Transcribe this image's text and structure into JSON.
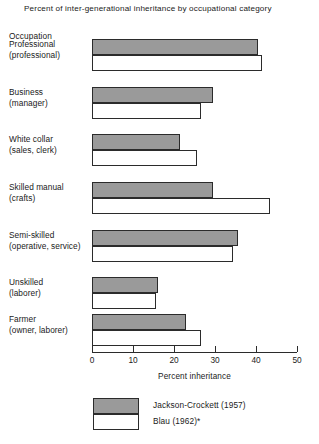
{
  "chart_data": {
    "type": "bar",
    "orientation": "horizontal",
    "title": "Percent of inter-generational inheritance by occupational category",
    "xlabel": "Percent inheritance",
    "ylabel": "Occupation",
    "xlim": [
      0,
      50
    ],
    "xticks": [
      0,
      10,
      20,
      30,
      40,
      50
    ],
    "xtick_labels": [
      "0",
      "10",
      "20",
      "30",
      "40",
      "50"
    ],
    "grid": false,
    "legend_position": "bottom",
    "categories": [
      "Professional (professional)",
      "Business (manager)",
      "White collar (sales, clerk)",
      "Skilled manual (crafts)",
      "Semi-skilled (operative, service)",
      "Unskilled (laborer)",
      "Farmer (owner, laborer)"
    ],
    "category_lines": [
      [
        "Professional",
        "(professional)"
      ],
      [
        "Business",
        "(manager)"
      ],
      [
        "White collar",
        "(sales, clerk)"
      ],
      [
        "Skilled manual",
        "(crafts)"
      ],
      [
        "Semi-skilled",
        "(operative, service)"
      ],
      [
        "Unskilled",
        "(laborer)"
      ],
      [
        "Farmer",
        "(owner, laborer)"
      ]
    ],
    "series": [
      {
        "name": "Jackson-Crockett (1957)",
        "color": "#9a9a9a",
        "values": [
          40.5,
          29.5,
          21.5,
          29.5,
          35.5,
          16.0,
          23.0
        ]
      },
      {
        "name": "Blau (1962)*",
        "color": "#ffffff",
        "values": [
          41.5,
          26.5,
          25.5,
          43.5,
          34.5,
          15.5,
          26.5
        ]
      }
    ]
  },
  "legend": {
    "entries": [
      {
        "label": "Jackson-Crockett (1957)"
      },
      {
        "label": "Blau (1962)*"
      }
    ]
  }
}
